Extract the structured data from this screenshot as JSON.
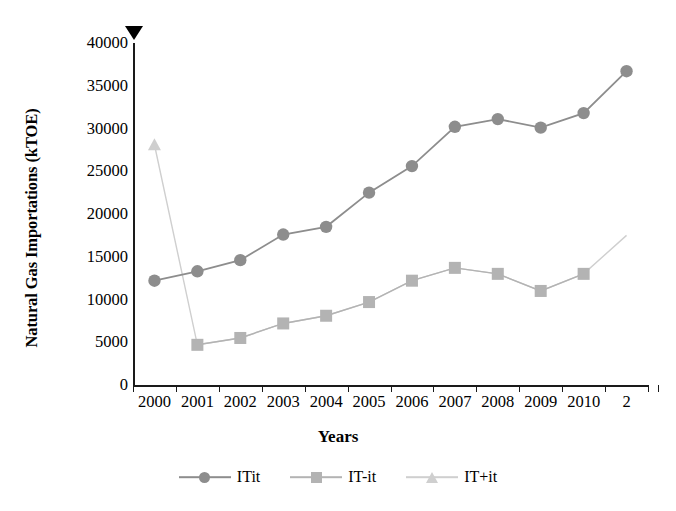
{
  "chart_data": {
    "type": "line",
    "title": "",
    "xlabel": "Years",
    "ylabel": "Natural Gas Importations (kTOE)",
    "x": [
      2000,
      2001,
      2002,
      2003,
      2004,
      2005,
      2006,
      2007,
      2008,
      2009,
      2010,
      2011
    ],
    "xtick_labels": [
      "2000",
      "2001",
      "2002",
      "2003",
      "2004",
      "2005",
      "2006",
      "2007",
      "2008",
      "2009",
      "2010",
      "2"
    ],
    "ytick_labels": [
      "40000",
      "35000",
      "30000",
      "25000",
      "20000",
      "15000",
      "10000",
      "5000",
      "0"
    ],
    "ytick_values": [
      40000,
      35000,
      30000,
      25000,
      20000,
      15000,
      10000,
      5000,
      0
    ],
    "ylim": [
      0,
      40000
    ],
    "xlim": [
      2000,
      2012
    ],
    "grid": false,
    "legend_position": "bottom",
    "series": [
      {
        "name": "ITit",
        "marker": "circle",
        "color": "#8d8d8d",
        "values": [
          12200,
          13300,
          14600,
          17600,
          18500,
          22500,
          25600,
          30200,
          31100,
          30100,
          31800,
          36700
        ]
      },
      {
        "name": "IT-it",
        "marker": "square",
        "color": "#b3b3b3",
        "values": [
          null,
          4700,
          5500,
          7200,
          8100,
          9700,
          12200,
          13700,
          13000,
          11000,
          13000,
          null
        ]
      },
      {
        "name": "IT+it",
        "marker": "triangle",
        "color": "#cfcfcf",
        "values": [
          28100,
          4700,
          5500,
          7200,
          8100,
          9700,
          12200,
          13700,
          13000,
          11000,
          13000,
          17500
        ]
      }
    ]
  },
  "annotations": {
    "top_axis_marker": "down-triangle-marker"
  },
  "legend": {
    "items": [
      {
        "label": "ITit",
        "marker": "circle",
        "color": "#8d8d8d"
      },
      {
        "label": "IT-it",
        "marker": "square",
        "color": "#b3b3b3"
      },
      {
        "label": "IT+it",
        "marker": "triangle",
        "color": "#cfcfcf"
      }
    ]
  },
  "colors": {
    "axis": "#1a1a1a",
    "text": "#000000",
    "background": "#ffffff",
    "series_1": "#8d8d8d",
    "series_2": "#b3b3b3",
    "series_3": "#cfcfcf"
  }
}
